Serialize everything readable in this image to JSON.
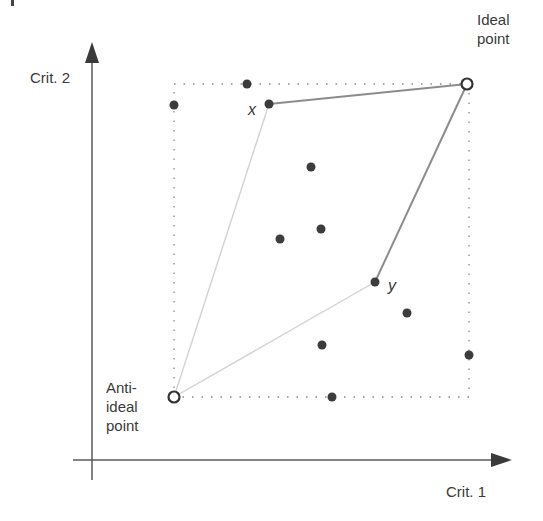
{
  "diagram": {
    "type": "multi-criteria decision space (TOPSIS ideal / anti-ideal)",
    "axes": {
      "x_label": "Crit. 1",
      "y_label": "Crit. 2"
    },
    "labels": {
      "ideal_line1": "Ideal",
      "ideal_line2": "point",
      "anti_line1": "Anti-",
      "anti_line2": "ideal",
      "anti_line3": "point",
      "x_point": "x",
      "y_point": "y"
    },
    "ideal_point": {
      "px": 467,
      "py": 84
    },
    "anti_ideal_point": {
      "px": 174,
      "py": 397
    },
    "bounding_box": {
      "left": 174,
      "top": 84,
      "right": 469,
      "bottom": 397,
      "style": "dotted"
    },
    "alternatives": [
      {
        "name": "x",
        "px": 269,
        "py": 104
      },
      {
        "name": "y",
        "px": 375,
        "py": 282
      },
      {
        "name": "a1",
        "px": 247,
        "py": 84
      },
      {
        "name": "a2",
        "px": 174,
        "py": 105
      },
      {
        "name": "a3",
        "px": 311,
        "py": 167
      },
      {
        "name": "a4",
        "px": 321,
        "py": 229
      },
      {
        "name": "a5",
        "px": 280,
        "py": 239
      },
      {
        "name": "a6",
        "px": 407,
        "py": 313
      },
      {
        "name": "a7",
        "px": 322,
        "py": 345
      },
      {
        "name": "a8",
        "px": 469,
        "py": 355
      },
      {
        "name": "a9",
        "px": 332,
        "py": 397
      }
    ],
    "connections": [
      {
        "from": "x",
        "to": "ideal_point",
        "color": "#8a8a8a"
      },
      {
        "from": "y",
        "to": "ideal_point",
        "color": "#8a8a8a"
      },
      {
        "from": "anti_ideal_point",
        "to": "x",
        "color": "#cfcfcf"
      },
      {
        "from": "anti_ideal_point",
        "to": "y",
        "color": "#cfcfcf"
      }
    ],
    "colors": {
      "axis": "#5a5a5a",
      "point": "#3c3c3c",
      "dotted_box": "#8a8a8a",
      "text": "#3a3a3a"
    }
  }
}
